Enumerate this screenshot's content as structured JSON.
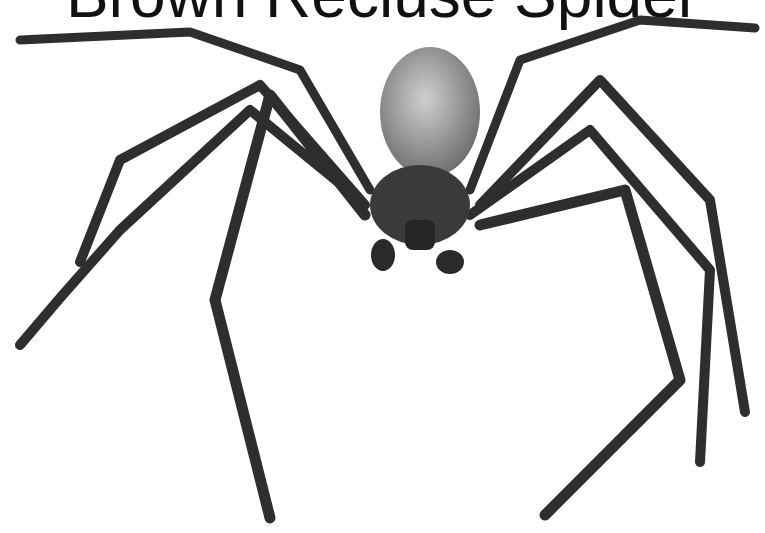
{
  "image": {
    "title_text_partial": "Brown Recluse Spider",
    "subject": "brown recluse spider illustration",
    "colors": {
      "background": "#ffffff",
      "legs": "#2e2e2e",
      "abdomen": "#9a9a9a",
      "cephalothorax": "#3a3a3a",
      "title": "#111111"
    }
  }
}
